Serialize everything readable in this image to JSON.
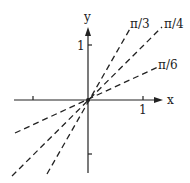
{
  "diagram": {
    "title": "",
    "axes": {
      "x_label": "x",
      "y_label": "y",
      "x_tick_label": "1",
      "y_tick_label": "1"
    },
    "lines": [
      {
        "label": "π/3",
        "angle": "π/3",
        "style": "dashed"
      },
      {
        "label": "π/4",
        "angle": "π/4",
        "style": "dashed"
      },
      {
        "label": "π/6",
        "angle": "π/6",
        "style": "dashed"
      }
    ]
  }
}
